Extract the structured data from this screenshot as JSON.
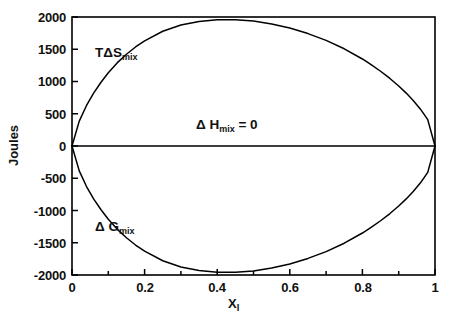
{
  "chart_data": {
    "type": "line",
    "title": "",
    "xlabel": "X",
    "xlabel_sub": "l",
    "ylabel": "Joules",
    "xlim": [
      0,
      1
    ],
    "ylim": [
      -2000,
      2000
    ],
    "grid": false,
    "legend": "none",
    "frame": "box",
    "xticks": [
      0,
      0.2,
      0.4,
      0.6,
      0.8,
      1
    ],
    "xtick_labels": [
      "0",
      "0.2",
      "0.4",
      "0.6",
      "0.8",
      "1"
    ],
    "xminor_step": 0.1,
    "yticks": [
      2000,
      1500,
      1000,
      500,
      0,
      -500,
      -1000,
      -1500,
      -2000
    ],
    "ytick_labels": [
      "2000",
      "1500",
      "1000",
      "500",
      "0",
      "-500",
      "-1000",
      "-1500",
      "-2000"
    ],
    "annotations": [
      {
        "name": "tds-mix-label",
        "text": "TΔS",
        "sub": "mix",
        "x": 0.08,
        "y": 1320
      },
      {
        "name": "dh-mix-label",
        "text": "Δ H",
        "sub": "mix",
        "suffix": " = 0",
        "x": 0.4,
        "y": 330
      },
      {
        "name": "dg-mix-label",
        "text": "Δ G",
        "sub": "mix",
        "x": 0.08,
        "y": -1380
      }
    ],
    "series": [
      {
        "name": "TΔS_mix",
        "label": "TΔS mix",
        "color": "#000000",
        "peak": 1700,
        "peak_x": 0.5,
        "x": [
          0,
          0.02,
          0.04,
          0.06,
          0.08,
          0.1,
          0.125,
          0.15,
          0.175,
          0.2,
          0.25,
          0.3,
          0.35,
          0.4,
          0.45,
          0.5,
          0.55,
          0.6,
          0.65,
          0.7,
          0.75,
          0.8,
          0.825,
          0.85,
          0.875,
          0.9,
          0.92,
          0.94,
          0.96,
          0.98,
          1
        ],
        "values": [
          0,
          386,
          628,
          823,
          989,
          1136,
          1292,
          1423,
          1535,
          1631,
          1779,
          1875,
          1932,
          1958,
          1959,
          1937,
          1893,
          1828,
          1743,
          1637,
          1507,
          1349,
          1258,
          1159,
          1051,
          930,
          824,
          706,
          571,
          409,
          0
        ]
      },
      {
        "name": "ΔG_mix",
        "label": "ΔG mix",
        "color": "#000000",
        "trough": -1700,
        "trough_x": 0.5,
        "x": [
          0,
          0.02,
          0.04,
          0.06,
          0.08,
          0.1,
          0.125,
          0.15,
          0.175,
          0.2,
          0.25,
          0.3,
          0.35,
          0.4,
          0.45,
          0.5,
          0.55,
          0.6,
          0.65,
          0.7,
          0.75,
          0.8,
          0.825,
          0.85,
          0.875,
          0.9,
          0.92,
          0.94,
          0.96,
          0.98,
          1
        ],
        "values": [
          0,
          -386,
          -628,
          -823,
          -989,
          -1136,
          -1292,
          -1423,
          -1535,
          -1631,
          -1779,
          -1875,
          -1932,
          -1958,
          -1959,
          -1937,
          -1893,
          -1828,
          -1743,
          -1637,
          -1507,
          -1349,
          -1258,
          -1159,
          -1051,
          -930,
          -824,
          -706,
          -571,
          -409,
          0
        ]
      },
      {
        "name": "ΔH_mix",
        "label": "ΔH mix = 0",
        "color": "#000000",
        "constant": 0,
        "x": [
          0,
          1
        ],
        "values": [
          0,
          0
        ]
      }
    ]
  }
}
